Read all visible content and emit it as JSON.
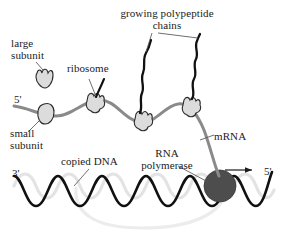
{
  "figure": {
    "background_color": "#ffffff"
  },
  "labels": {
    "growing_polypeptide": "growing polypeptide\nchains",
    "large_subunit": "large\nsubunit",
    "ribosome": "ribosome",
    "small_subunit": "small\nsubunit",
    "copied_dna": "copied DNA",
    "rna_polymerase": "RNA\npolymerase",
    "mrna": "mRNA"
  },
  "end_markers": {
    "mrna_five_prime": "5'",
    "dna_three_prime": "3'",
    "dna_five_prime": "5'"
  },
  "colors": {
    "ink": "#1b1b1b",
    "mrna_strand": "#6e6e6e",
    "dna_strand": "#111111",
    "dna_template_ghost": "#e2e2e2",
    "polymerase_fill": "#4a4a4a",
    "ribosome_fill": "#d9d9d9",
    "leader_line": "#555555"
  },
  "structures": {
    "ribosome_count": 4,
    "polypeptide_chain_count": 2,
    "free_large_subunit": 1,
    "free_small_subunit": 1,
    "transcription_direction_arrow": "right"
  }
}
